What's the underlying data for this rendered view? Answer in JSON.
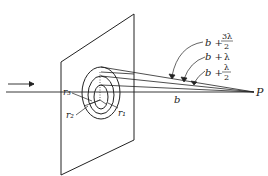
{
  "diagram": {
    "type": "fresnel-zone-construction",
    "labels": {
      "r1": "r₁",
      "r2": "r₂",
      "r3": "r₃",
      "b": "b",
      "P": "P",
      "path1_prefix": "b +",
      "path1_num": "λ",
      "path1_den": "2",
      "path2_prefix": "b +",
      "path2_val": "λ",
      "path3_prefix": "b +",
      "path3_num": "3λ",
      "path3_den": "2"
    },
    "colors": {
      "line": "#222222",
      "background": "#ffffff"
    }
  }
}
